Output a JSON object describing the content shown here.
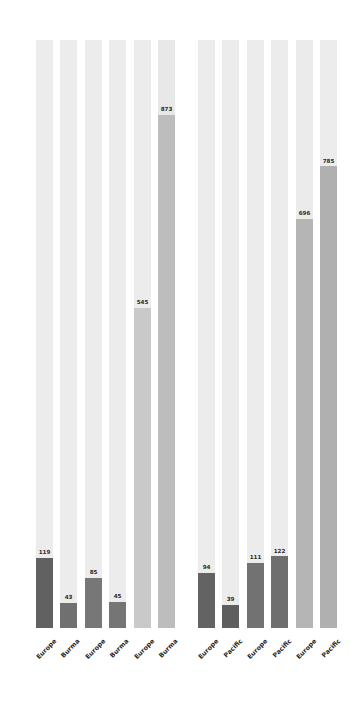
{
  "chart_data": {
    "type": "bar",
    "title": "",
    "subtitle": "",
    "xlabel": "",
    "ylabel": "",
    "ylim": [
      0,
      1000
    ],
    "grid": false,
    "legend": false,
    "orientation": "vertical",
    "style": "bullet-track bars with background capacity track",
    "track_max": 1000,
    "groups": [
      {
        "name": "left-group",
        "bars": [
          {
            "category": "Europe",
            "value": 119,
            "label": "119",
            "fill_color": "#616161",
            "track_color": "#ececec"
          },
          {
            "category": "Burma",
            "value": 43,
            "label": "43",
            "fill_color": "#707070",
            "track_color": "#ececec"
          },
          {
            "category": "Europe",
            "value": 85,
            "label": "85",
            "fill_color": "#777777",
            "track_color": "#ececec"
          },
          {
            "category": "Burma",
            "value": 45,
            "label": "45",
            "fill_color": "#757575",
            "track_color": "#ececec"
          },
          {
            "category": "Europe",
            "value": 545,
            "label": "545",
            "fill_color": "#c9c9c9",
            "track_color": "#ececec"
          },
          {
            "category": "Burma",
            "value": 873,
            "label": "873",
            "fill_color": "#bdbdbd",
            "track_color": "#e8e8e8"
          }
        ]
      },
      {
        "name": "right-group",
        "bars": [
          {
            "category": "Europe",
            "value": 94,
            "label": "94",
            "fill_color": "#636363",
            "track_color": "#ececec"
          },
          {
            "category": "Pacific",
            "value": 39,
            "label": "39",
            "fill_color": "#5e5e5e",
            "track_color": "#ececec"
          },
          {
            "category": "Europe",
            "value": 111,
            "label": "111",
            "fill_color": "#727272",
            "track_color": "#ececec"
          },
          {
            "category": "Pacific",
            "value": 122,
            "label": "122",
            "fill_color": "#6e6e6e",
            "track_color": "#ececec"
          },
          {
            "category": "Europe",
            "value": 696,
            "label": "696",
            "fill_color": "#b5b5b5",
            "track_color": "#ebebeb"
          },
          {
            "category": "Pacific",
            "value": 785,
            "label": "785",
            "fill_color": "#b0b0b0",
            "track_color": "#ececec"
          }
        ]
      }
    ],
    "categories": [
      "Europe",
      "Burma",
      "Europe",
      "Burma",
      "Europe",
      "Burma",
      "Europe",
      "Pacific",
      "Europe",
      "Pacific",
      "Europe",
      "Pacific"
    ],
    "values": [
      119,
      43,
      85,
      45,
      545,
      873,
      94,
      39,
      111,
      122,
      696,
      785
    ],
    "value_labels": [
      "119",
      "43",
      "85",
      "45",
      "545",
      "873",
      "94",
      "39",
      "111",
      "122",
      "696",
      "785"
    ]
  },
  "layout": {
    "bar_width": 17,
    "baseline_px": 88,
    "track_height_px": 588,
    "x_positions": [
      36,
      60,
      85,
      109,
      134,
      158,
      198,
      222,
      247,
      271,
      296,
      320
    ]
  }
}
